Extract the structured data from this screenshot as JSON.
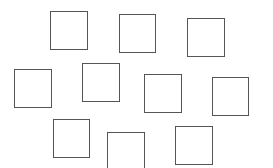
{
  "diagram": {
    "stroke_color": "#555555",
    "background_color": "#ffffff",
    "shapes": [
      {
        "id": "square-1",
        "row": 1,
        "x": 50,
        "y": 11,
        "w": 38,
        "h": 39
      },
      {
        "id": "square-2",
        "row": 1,
        "x": 119,
        "y": 14,
        "w": 37,
        "h": 39
      },
      {
        "id": "square-3",
        "row": 1,
        "x": 187,
        "y": 18,
        "w": 38,
        "h": 39
      },
      {
        "id": "square-4",
        "row": 2,
        "x": 14,
        "y": 69,
        "w": 38,
        "h": 39
      },
      {
        "id": "square-5",
        "row": 2,
        "x": 82,
        "y": 63,
        "w": 38,
        "h": 39
      },
      {
        "id": "square-6",
        "row": 2,
        "x": 144,
        "y": 74,
        "w": 38,
        "h": 39
      },
      {
        "id": "square-7",
        "row": 2,
        "x": 212,
        "y": 77,
        "w": 37,
        "h": 39
      },
      {
        "id": "square-8",
        "row": 3,
        "x": 53,
        "y": 119,
        "w": 37,
        "h": 39
      },
      {
        "id": "square-9",
        "row": 3,
        "x": 107,
        "y": 132,
        "w": 38,
        "h": 39
      },
      {
        "id": "square-10",
        "row": 3,
        "x": 175,
        "y": 126,
        "w": 38,
        "h": 39
      }
    ]
  }
}
